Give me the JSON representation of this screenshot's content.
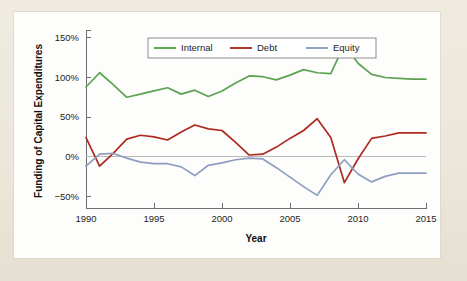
{
  "figure": {
    "background_color": "#efeade",
    "panel_color": "#fdfdfb"
  },
  "axes": {
    "x_title": "Year",
    "y_title": "Funding of Capital Expenditures",
    "x_ticks": [
      "1990",
      "1995",
      "2000",
      "2005",
      "2010",
      "2015"
    ],
    "y_ticks": [
      "150%",
      "100%",
      "50%",
      "0%",
      "−50%"
    ]
  },
  "legend": {
    "items": [
      {
        "label": "Internal",
        "color": "#5ba352"
      },
      {
        "label": "Debt",
        "color": "#ad2a20"
      },
      {
        "label": "Equity",
        "color": "#8e9dc0"
      }
    ]
  },
  "chart_data": {
    "type": "line",
    "title": "",
    "xlabel": "Year",
    "ylabel": "Funding of Capital Expenditures",
    "xlim": [
      1990,
      2015
    ],
    "ylim": [
      -65,
      155
    ],
    "xticks": [
      1990,
      1995,
      2000,
      2005,
      2010,
      2015
    ],
    "yticks": [
      -50,
      0,
      50,
      100,
      150
    ],
    "ytick_labels": [
      "−50%",
      "0%",
      "50%",
      "100%",
      "150%"
    ],
    "grid": false,
    "legend_position": "top-center",
    "x": [
      1990,
      1991,
      1992,
      1993,
      1994,
      1995,
      1996,
      1997,
      1998,
      1999,
      2000,
      2001,
      2002,
      2003,
      2004,
      2005,
      2006,
      2007,
      2008,
      2009,
      2010,
      2011,
      2012,
      2013,
      2014,
      2015
    ],
    "series": [
      {
        "name": "Internal",
        "color": "#5ba352",
        "values": [
          88,
          106,
          91,
          75,
          79,
          83,
          87,
          79,
          84,
          76,
          83,
          93,
          102,
          101,
          97,
          103,
          110,
          106,
          105,
          142,
          118,
          104,
          100,
          99,
          98,
          98
        ]
      },
      {
        "name": "Debt",
        "color": "#ad2a20",
        "values": [
          24,
          -12,
          4,
          22,
          27,
          25,
          21,
          31,
          40,
          35,
          33,
          18,
          2,
          3,
          12,
          23,
          33,
          48,
          24,
          -33,
          -3,
          23,
          26,
          30,
          30,
          30
        ]
      },
      {
        "name": "Equity",
        "color": "#8e9dc0",
        "values": [
          -12,
          3,
          4,
          -2,
          -7,
          -9,
          -9,
          -13,
          -24,
          -11,
          -8,
          -4,
          -2,
          -3,
          -14,
          -26,
          -38,
          -49,
          -23,
          -4,
          -22,
          -32,
          -25,
          -21,
          -21,
          -21
        ]
      }
    ]
  }
}
